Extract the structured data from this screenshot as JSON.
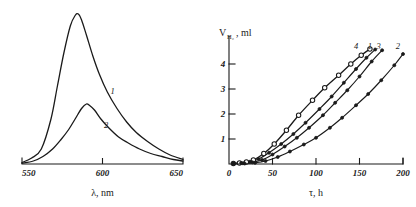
{
  "figure": {
    "panels": [
      "fluorescence-spectra",
      "hydrogen-evolution-kinetics"
    ]
  },
  "chart_data": [
    {
      "type": "line",
      "id": "left",
      "title": "",
      "xlabel": "λ, nm",
      "ylabel": "",
      "xlim": [
        550,
        650
      ],
      "ylim": [
        0,
        1.0
      ],
      "xticks": [
        550,
        600,
        650
      ],
      "xtick_labels": [
        "550",
        "600",
        "650"
      ],
      "yticks": [],
      "grid": false,
      "legend": "inline-curve-labels",
      "series": [
        {
          "name": "1",
          "label": "1",
          "label_x": 605,
          "label_y": 0.47,
          "marker": "none",
          "x": [
            550,
            556,
            562,
            568,
            572,
            576,
            580,
            583,
            585,
            587,
            590,
            594,
            598,
            603,
            609,
            615,
            621,
            628,
            635,
            642,
            650
          ],
          "values": [
            0.01,
            0.04,
            0.1,
            0.3,
            0.52,
            0.74,
            0.92,
            0.99,
            1.0,
            0.96,
            0.86,
            0.72,
            0.6,
            0.48,
            0.37,
            0.28,
            0.21,
            0.15,
            0.1,
            0.06,
            0.03
          ]
        },
        {
          "name": "2",
          "label": "2",
          "label_x": 601,
          "label_y": 0.24,
          "marker": "none",
          "x": [
            550,
            557,
            563,
            569,
            574,
            579,
            583,
            587,
            590,
            592,
            595,
            599,
            604,
            610,
            616,
            623,
            630,
            637,
            644,
            650
          ],
          "values": [
            0.005,
            0.02,
            0.05,
            0.1,
            0.16,
            0.23,
            0.3,
            0.37,
            0.4,
            0.39,
            0.36,
            0.3,
            0.24,
            0.18,
            0.14,
            0.1,
            0.07,
            0.05,
            0.03,
            0.02
          ]
        }
      ]
    },
    {
      "type": "line",
      "id": "right",
      "title": "",
      "xlabel": "τ, h",
      "ylabel": "V",
      "ylabel_sub": "H₂",
      "ylabel_unit": ", ml",
      "xlim": [
        0,
        200
      ],
      "ylim": [
        0,
        4.8
      ],
      "xticks": [
        0,
        50,
        100,
        150,
        200
      ],
      "xtick_labels": [
        "0",
        "50",
        "100",
        "150",
        "200"
      ],
      "yticks": [
        1,
        2,
        3,
        4
      ],
      "ytick_labels": [
        "1",
        "2",
        "3",
        "4"
      ],
      "grid": false,
      "legend": "inline-curve-labels",
      "series": [
        {
          "name": "4",
          "label": "4",
          "label_x": 146,
          "label_y": 4.62,
          "marker": "open-circle",
          "x": [
            5,
            12,
            20,
            28,
            40,
            52,
            66,
            80,
            96,
            110,
            126,
            140,
            152,
            162
          ],
          "values": [
            0.02,
            0.04,
            0.08,
            0.16,
            0.42,
            0.8,
            1.35,
            1.95,
            2.55,
            3.05,
            3.55,
            4.0,
            4.35,
            4.6
          ]
        },
        {
          "name": "1",
          "label": "1",
          "label_x": 162,
          "label_y": 4.62,
          "marker": "filled-circle",
          "x": [
            5,
            14,
            24,
            34,
            46,
            60,
            74,
            88,
            104,
            118,
            132,
            146,
            158,
            168
          ],
          "values": [
            0.02,
            0.04,
            0.09,
            0.2,
            0.45,
            0.8,
            1.2,
            1.65,
            2.2,
            2.7,
            3.25,
            3.8,
            4.25,
            4.58
          ]
        },
        {
          "name": "3",
          "label": "3",
          "label_x": 172,
          "label_y": 4.62,
          "marker": "filled-circle",
          "x": [
            5,
            16,
            27,
            38,
            50,
            64,
            78,
            92,
            108,
            122,
            136,
            150,
            164,
            176
          ],
          "values": [
            0.015,
            0.03,
            0.07,
            0.16,
            0.38,
            0.7,
            1.05,
            1.45,
            1.95,
            2.45,
            2.95,
            3.5,
            4.1,
            4.55
          ]
        },
        {
          "name": "2",
          "label": "2",
          "label_x": 194,
          "label_y": 4.62,
          "marker": "filled-circle",
          "x": [
            5,
            18,
            30,
            42,
            56,
            70,
            86,
            100,
            116,
            130,
            146,
            160,
            175,
            190,
            200
          ],
          "values": [
            0.01,
            0.02,
            0.05,
            0.12,
            0.28,
            0.5,
            0.78,
            1.05,
            1.45,
            1.85,
            2.35,
            2.8,
            3.35,
            3.95,
            4.4
          ]
        }
      ]
    }
  ]
}
